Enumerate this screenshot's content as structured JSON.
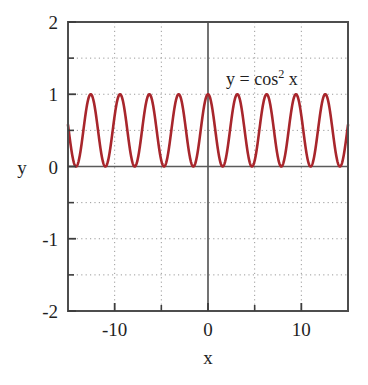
{
  "chart_data": {
    "type": "line",
    "title": "",
    "subtitle": "",
    "xlabel": "x",
    "ylabel": "y",
    "xlim": [
      -15,
      15
    ],
    "ylim": [
      -2,
      2
    ],
    "grid": true,
    "grid_style": "dotted",
    "legend_position": "none",
    "annotations": [
      {
        "id": "equation",
        "text": "y = cos2 x",
        "lhs": "y = cos",
        "exponent": "2",
        "rhs": " x",
        "x_data": 6.2,
        "y_data": 1.42
      }
    ],
    "x_ticks": [
      -15,
      -10,
      -5,
      0,
      5,
      10,
      15
    ],
    "x_tick_labels": [
      "",
      "-10",
      "",
      "0",
      "",
      "10",
      ""
    ],
    "x_major_labeled": [
      "-10",
      "0",
      "10"
    ],
    "y_ticks": [
      -2,
      -1.5,
      -1,
      -0.5,
      0,
      0.5,
      1,
      1.5,
      2
    ],
    "y_tick_labels": [
      "-2",
      "",
      "-1",
      "",
      "0",
      "",
      "1",
      "",
      "2"
    ],
    "y_major_labeled": [
      "2",
      "1",
      "0",
      "-1",
      "-2"
    ],
    "series": [
      {
        "name": "y = cos^2 x",
        "expression": "cos(x)^2",
        "color": "#a8262c",
        "line_width": 2.6,
        "period": 3.14159265,
        "amplitude": 0.5,
        "offset": 0.5,
        "min_value": 0,
        "max_value": 1,
        "peaks_x": [
          -14.137,
          -10.996,
          -7.854,
          -4.712,
          -1.571,
          0,
          1.571,
          4.712,
          7.854,
          10.996,
          14.137
        ],
        "peak_value": 1,
        "troughs_x": [
          -14.137,
          -10.996,
          -7.854,
          -4.712,
          -1.571,
          1.571,
          4.712,
          7.854,
          10.996,
          14.137
        ],
        "trough_value": 0,
        "endpoint_left": {
          "x": -15,
          "y": 0.52
        },
        "endpoint_right": {
          "x": 15,
          "y": 0.52
        },
        "sample_points": [
          {
            "x": -15,
            "y": 0.52
          },
          {
            "x": -12.566,
            "y": 1
          },
          {
            "x": -11,
            "y": 0
          },
          {
            "x": -9.425,
            "y": 1
          },
          {
            "x": -7.854,
            "y": 0
          },
          {
            "x": -6.283,
            "y": 1
          },
          {
            "x": -4.712,
            "y": 0
          },
          {
            "x": -3.142,
            "y": 1
          },
          {
            "x": -1.571,
            "y": 0
          },
          {
            "x": 0,
            "y": 1
          },
          {
            "x": 1.571,
            "y": 0
          },
          {
            "x": 3.142,
            "y": 1
          },
          {
            "x": 4.712,
            "y": 0
          },
          {
            "x": 6.283,
            "y": 1
          },
          {
            "x": 7.854,
            "y": 0
          },
          {
            "x": 9.425,
            "y": 1
          },
          {
            "x": 11,
            "y": 0
          },
          {
            "x": 12.566,
            "y": 1
          },
          {
            "x": 15,
            "y": 0.52
          }
        ]
      }
    ],
    "colors": {
      "curve": "#a8262c",
      "frame": "#4d4d4d",
      "zero_axis": "#5a5a5a",
      "grid": "#9a9a9a",
      "text": "#1f1f1f",
      "background": "#ffffff"
    }
  },
  "tick_labels": {
    "y2": "2",
    "y1": "1",
    "y0": "0",
    "ym1": "-1",
    "ym2": "-2",
    "xm10": "-10",
    "x0": "0",
    "x10": "10"
  },
  "axis_titles": {
    "x": "x",
    "y": "y"
  },
  "annotation": {
    "lhs": "y = cos",
    "exponent": "2",
    "rhs": " x"
  }
}
